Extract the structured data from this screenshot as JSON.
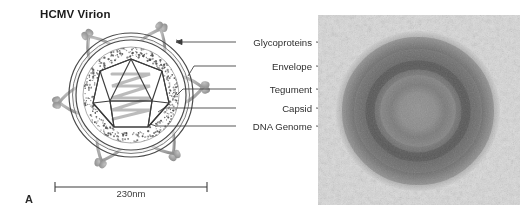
{
  "figure": {
    "panel_letter": "A",
    "title": "HCMV Virion",
    "background_color": "#ffffff"
  },
  "scale_bar": {
    "caption": "230nm",
    "x_start": 55,
    "x_end": 207,
    "y": 187
  },
  "callouts": [
    {
      "id": "glycoproteins",
      "label": "Glycoproteins",
      "y": 42,
      "has_arrowhead": true
    },
    {
      "id": "envelope",
      "label": "Envelope",
      "y": 66,
      "has_arrowhead": false
    },
    {
      "id": "tegument",
      "label": "Tegument",
      "y": 89,
      "has_arrowhead": false
    },
    {
      "id": "capsid",
      "label": "Capsid",
      "y": 108,
      "has_arrowhead": false
    },
    {
      "id": "dna_genome",
      "label": "DNA Genome",
      "y": 126,
      "has_arrowhead": false
    }
  ],
  "diagram": {
    "center_x": 131,
    "center_y": 95,
    "envelope_outer_radius": 62,
    "envelope_inner_radius": 55,
    "tegument_radius": 48,
    "capsid_radius": 36,
    "spike_count": 12,
    "colors": {
      "outline": "#4a4a4a",
      "spike": "#9a9a9a",
      "tegument_stipple": "#4a4a4a",
      "dna": "#b3b3b3",
      "capsid_line": "#3c3c3c"
    }
  },
  "micrograph": {
    "type": "electron-micrograph",
    "x": 318,
    "y": 15,
    "width": 202,
    "height": 190,
    "description": "grayscale transmission electron micrograph of a single HCMV virion showing concentric dark capsid ring surrounded by tegument and envelope"
  }
}
